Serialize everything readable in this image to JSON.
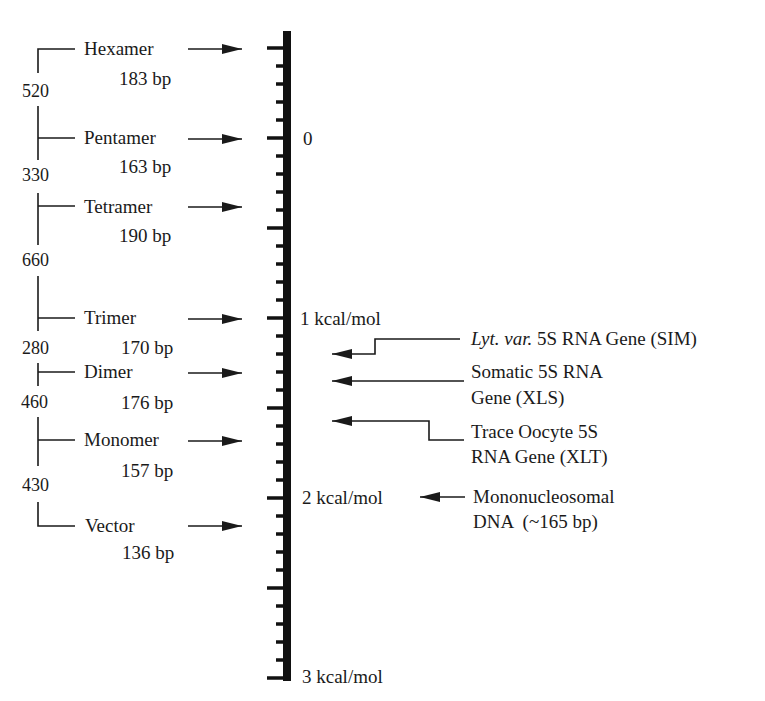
{
  "diagram": {
    "type": "energy-scale-diagram",
    "scale": {
      "unit": "kcal/mol",
      "ticks": [
        {
          "y": 138,
          "label": "0"
        },
        {
          "y": 318,
          "label": "1 kcal/mol"
        },
        {
          "y": 498,
          "label": "2 kcal/mol"
        },
        {
          "y": 678,
          "label": "3 kcal/mol"
        }
      ],
      "major_tick_interval": 0.5,
      "minor_tick_interval": 0.1
    },
    "constructs": [
      {
        "name": "Hexamer",
        "size": "183 bp",
        "y": 48
      },
      {
        "name": "Pentamer",
        "size": "163 bp",
        "y": 138
      },
      {
        "name": "Tetramer",
        "size": "190 bp",
        "y": 206
      },
      {
        "name": "Trimer",
        "size": "170 bp",
        "y": 318
      },
      {
        "name": "Dimer",
        "size": "176 bp",
        "y": 372
      },
      {
        "name": "Monomer",
        "size": "157 bp",
        "y": 440
      },
      {
        "name": "Vector",
        "size": "136 bp",
        "y": 525
      }
    ],
    "bracket_values": [
      "520",
      "330",
      "660",
      "280",
      "460",
      "430"
    ],
    "references": [
      {
        "italic": "Lyt. var.",
        "text": " 5S RNA Gene (SIM)"
      },
      {
        "line1": "Somatic 5S RNA",
        "line2": "Gene (XLS)"
      },
      {
        "line1": "Trace Oocyte 5S",
        "line2": "RNA Gene (XLT)"
      },
      {
        "line1": "Mononucleosomal",
        "line2": "DNA  (~165 bp)"
      }
    ]
  }
}
